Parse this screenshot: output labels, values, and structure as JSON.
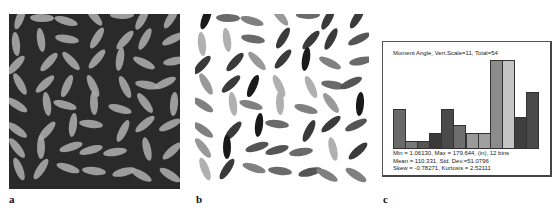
{
  "figure": {
    "panels": [
      {
        "id": "a",
        "label": "a",
        "description": "Grayscale photo of rice grains on dark background"
      },
      {
        "id": "b",
        "label": "b",
        "description": "Grains shaded by measured orientation angle on white background"
      },
      {
        "id": "c",
        "label": "c",
        "description": "Histogram of moment angle"
      }
    ]
  },
  "histogram": {
    "title": "Moment Angle, Vert.Scale=11, Total=54",
    "stats_line1": "Min = 1.06130, Max = 179.644, (in), 12 bins",
    "stats_line2": "Mean = 110.331, Std. Dev.=51.0796",
    "stats_line3": "Skew = -0.78271, Kurtosis = 2.52111"
  },
  "chart_data": {
    "type": "bar",
    "title": "Moment Angle, Vert.Scale=11, Total=54",
    "xlabel": "Moment angle (bins from 1.06130 to 179.644)",
    "ylabel": "Count",
    "categories": [
      "1",
      "2",
      "3",
      "4",
      "5",
      "6",
      "7",
      "8",
      "9",
      "10",
      "11",
      "12"
    ],
    "values": [
      5,
      1,
      1,
      2,
      5,
      3,
      2,
      2,
      11,
      11,
      4,
      7
    ],
    "colors": [
      "#6a6a6a",
      "#7a7a7a",
      "#555555",
      "#3a3a3a",
      "#4a4a4a",
      "#6e6e6e",
      "#9a9a9a",
      "#a0a0a0",
      "#8c8c8c",
      "#c4c4c4",
      "#3e3e3e",
      "#4a4a4a"
    ],
    "ylim": [
      0,
      11
    ],
    "grid": false,
    "stats": {
      "min": 1.0613,
      "max": 179.644,
      "bins": 12,
      "mean": 110.331,
      "std_dev": 51.0796,
      "skew": -0.78271,
      "kurtosis": 2.52111,
      "total": 54
    }
  }
}
